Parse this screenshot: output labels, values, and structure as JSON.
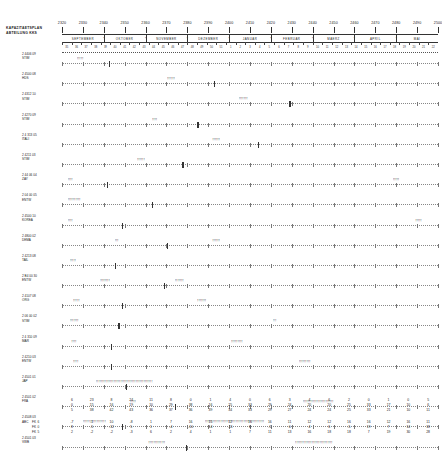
{
  "header": {
    "title_line1": "KAPAZITAETSPLAN",
    "title_line2": "ABTEILUNG  KKS",
    "scale_numbers": [
      "2320",
      "2330",
      "2340",
      "2350",
      "2360",
      "2370",
      "2380",
      "2390",
      "2400",
      "2410",
      "2420",
      "2430",
      "2440",
      "2450",
      "2460",
      "2470",
      "2480",
      "2490",
      "2500"
    ],
    "months": [
      "SEPTEMBER",
      "OKTOBER",
      "NOVEMBER",
      "DEZEMBER",
      "JANUAR",
      "FEBRUAR",
      "MAERZ",
      "APRIL",
      "MAI"
    ],
    "month_mark": "*",
    "day_numbers": [
      "35",
      "36",
      "37",
      "38",
      "39",
      "40",
      "41",
      "42",
      "43",
      "44",
      "45",
      "46",
      "47",
      "48",
      "49",
      "50",
      "51",
      "1",
      "2",
      "3",
      "4",
      "5",
      "6",
      "7",
      "8",
      "9",
      "10",
      "11",
      "12",
      "13",
      "14",
      "15",
      "16",
      "17",
      "18",
      "19",
      "20",
      "21",
      "22"
    ]
  },
  "rows": [
    {
      "code": "2 4406 09",
      "name": "STIM",
      "bar_start": 4.0,
      "bar_len": 6.0,
      "bar_text": "!!!!!",
      "anchor": 12.5
    },
    {
      "code": "2 4500 08",
      "name": "HDS",
      "bar_start": 28.0,
      "bar_len": 6.5,
      "bar_text": "!!!!!!",
      "anchor": 40.5
    },
    {
      "code": "2 4312 10",
      "name": "STIM",
      "bar_start": 47.0,
      "bar_len": 8.0,
      "bar_text": "!!!!!!!",
      "anchor": 60.5
    },
    {
      "code": "2 4270 09",
      "name": "STIM",
      "bar_start": 24.0,
      "bar_len": 5.0,
      "bar_text": "!!!!",
      "anchor": 36.0
    },
    {
      "code": "2 4 313 05",
      "name": "ITALI",
      "bar_start": 40.0,
      "bar_len": 7.0,
      "bar_text": "!!!!!!",
      "anchor": 52.0
    },
    {
      "code": "2 4211 03",
      "name": "STIM",
      "bar_start": 20.0,
      "bar_len": 6.0,
      "bar_text": "!!!!!!",
      "anchor": 32.0
    },
    {
      "code": "2 44 06  04",
      "name": "ZAY",
      "bar_start": 1.5,
      "bar_len": 4.0,
      "bar_text": "!!!!",
      "anchor": 12.0,
      "bar2_start": 88.0,
      "bar2_len": 6.0,
      "bar2_text": "!!!!!"
    },
    {
      "code": "2 04 00  05",
      "name": "ENTW",
      "bar_start": 1.5,
      "bar_len": 12.0,
      "bar_text": "!!!!!!!!!!",
      "anchor": 24.0
    },
    {
      "code": "2 4500 10",
      "name": "KOREA",
      "bar_start": 1.5,
      "bar_len": 5.0,
      "bar_text": "!!!!",
      "anchor": 16.0,
      "bar2_start": 94.0,
      "bar2_len": 5.0,
      "bar2_text": "!!!!!"
    },
    {
      "code": "2 4800 02",
      "name": "DEMA",
      "bar_start": 14.0,
      "bar_len": 5.0,
      "bar_text": "!!!",
      "anchor": 28.0,
      "bar2_start": 40.0,
      "bar2_len": 6.0,
      "bar2_text": "!!!!!!"
    },
    {
      "code": "2 4213 08",
      "name": "TAIL",
      "bar_start": 2.0,
      "bar_len": 6.0,
      "bar_text": "!!!!!",
      "anchor": 14.0
    },
    {
      "code": "2 B4 00  30",
      "name": "ENTW",
      "bar_start": 10.0,
      "bar_len": 10.0,
      "bar_text": "!!!!!!!!",
      "anchor": 27.0,
      "bar2_start": 30.0,
      "bar2_len": 9.0,
      "bar2_text": "!!!!!!!"
    },
    {
      "code": "2 4107 08",
      "name": "ORG",
      "bar_start": 3.0,
      "bar_len": 6.0,
      "bar_text": "!!!!!",
      "anchor": 16.0,
      "bar2_start": 36.0,
      "bar2_len": 8.0,
      "bar2_text": "!!!!!!!"
    },
    {
      "code": "2 06 00  02",
      "name": "STIM",
      "bar_start": 2.0,
      "bar_len": 8.0,
      "bar_text": "!!!!!!!",
      "anchor": 15.0,
      "bar2_start": 56.0,
      "bar2_len": 4.0,
      "bar2_text": "!!!"
    },
    {
      "code": "2 4 310 09",
      "name": "MAR",
      "bar_start": 2.5,
      "bar_len": 5.0,
      "bar_text": "!!!!",
      "anchor": 13.0,
      "bar2_start": 45.0,
      "bar2_len": 11.0,
      "bar2_text": "!!!!!!!!!"
    },
    {
      "code": "2 4210 03",
      "name": "ENTW",
      "bar_start": 3.0,
      "bar_len": 5.0,
      "bar_text": "!!!!",
      "anchor": 13.0,
      "bar2_start": 63.0,
      "bar2_len": 11.0,
      "bar2_text": "!!!!!!!!!"
    },
    {
      "code": "2 4501 01",
      "name": "JAP",
      "bar_start": 9.0,
      "bar_len": 52.0,
      "bar_text": "!!!!!!!!!!!!!!!!!!!!!!!!!!!!!!!!!!!!!!!!!!!!",
      "anchor": 17.0
    },
    {
      "code": "2 4501 02",
      "name": "FRA",
      "bar_start": 18.0,
      "bar_len": 6.0,
      "bar_text": "!!!!!",
      "anchor": 30.0,
      "bar2_start": 64.0,
      "bar2_len": 30.0,
      "bar2_text": "!!!!!!!!!!!!!!!!!!!!!!!!"
    },
    {
      "code": "2 4508 03",
      "name": "ABC",
      "bar_start": 5.5,
      "bar_len": 22.0,
      "bar_text": "!!!!!!!!!!!!!!!!!!",
      "anchor": 16.0,
      "bar2_start": 38.0,
      "bar2_len": 56.0,
      "bar2_text": "!!!!!!!!!!!!!!!!!!!!!!!!!!!!!!!!!!!!!!!!!!!!!!"
    },
    {
      "code": "2 4501 03",
      "name": "VWB",
      "bar_start": 23.0,
      "bar_len": 16.0,
      "bar_text": "!!!!!!!!!!!!!",
      "anchor": 33.0,
      "bar2_start": 62.0,
      "bar2_len": 36.0,
      "bar2_text": "!!!!!!!!!!!!!!!!!!!!!!!!!!!!!"
    }
  ],
  "footer": {
    "row_labels_top": [
      "",
      "",
      ""
    ],
    "row_labels_bottom": [
      "FK 6",
      "FK 0",
      "FK 5"
    ],
    "columns": [
      {
        "top": [
          "6",
          "0",
          "5"
        ],
        "bot": [
          "-7",
          "8",
          "2"
        ]
      },
      {
        "top": [
          "23",
          "15",
          "38"
        ],
        "bot": [
          "-1",
          "-5",
          "-2"
        ]
      },
      {
        "top": [
          "8",
          "16",
          "42"
        ],
        "bot": [
          "10",
          "-12",
          "-2"
        ]
      },
      {
        "top": [
          "24",
          "19",
          "43"
        ],
        "bot": [
          "-8",
          "5",
          "-3"
        ]
      },
      {
        "top": [
          "11",
          "10",
          "36"
        ],
        "bot": [
          "1",
          "1",
          "6"
        ]
      },
      {
        "top": [
          "8",
          "29",
          "37"
        ],
        "bot": [
          "7",
          "-4",
          "2"
        ]
      },
      {
        "top": [
          "0",
          "38",
          "36"
        ],
        "bot": [
          "16",
          "-10",
          "4"
        ]
      },
      {
        "top": [
          "1",
          "16",
          "39"
        ],
        "bot": [
          "15",
          "14",
          "1"
        ]
      },
      {
        "top": [
          "4",
          "25",
          "34"
        ],
        "bot": [
          "12",
          "-11",
          "1"
        ]
      },
      {
        "top": [
          "0",
          "33",
          "33"
        ],
        "bot": [
          "16",
          "6",
          "7"
        ]
      },
      {
        "top": [
          "6",
          "29",
          "29"
        ],
        "bot": [
          "16",
          "-5",
          "11"
        ]
      },
      {
        "top": [
          "3",
          "24",
          "27"
        ],
        "bot": [
          "11",
          "0",
          "13"
        ]
      },
      {
        "top": [
          "4",
          "20",
          "24"
        ],
        "bot": [
          "12",
          "4",
          "16"
        ]
      },
      {
        "top": [
          "6",
          "20",
          "24"
        ],
        "bot": [
          "12",
          "6",
          "18"
        ]
      },
      {
        "top": [
          "2",
          "25",
          "25"
        ],
        "bot": [
          "16",
          "-5",
          "18"
        ]
      },
      {
        "top": [
          "0",
          "33",
          "33"
        ],
        "bot": [
          "16",
          "19",
          "7"
        ]
      },
      {
        "top": [
          "1",
          "17",
          "21"
        ],
        "bot": [
          "12",
          "7",
          "19"
        ]
      },
      {
        "top": [
          "0",
          "10",
          "10"
        ],
        "bot": [
          "16",
          "14",
          "30"
        ]
      },
      {
        "top": [
          "5",
          "6",
          "11"
        ],
        "bot": [
          "11",
          "18",
          "28"
        ]
      }
    ]
  }
}
